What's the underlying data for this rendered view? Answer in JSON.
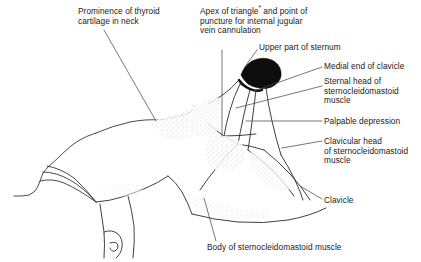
{
  "figure": {
    "type": "anatomical-line-illustration",
    "background_color": "#ffffff",
    "line_color": "#1a1a1a",
    "fill_color": "#000000",
    "stipple_color": "#9a9a9a",
    "text_color": "#1a1a1a"
  },
  "labels": {
    "thyroid": "Prominence of thyroid\ncartilage in neck",
    "apex_line1": "Apex of triangle",
    "apex_marker": "*",
    "apex_line2": " and point of\npuncture for internal jugular\nvein cannulation",
    "sternum": "Upper part of sternum",
    "medial_clavicle": "Medial end of clavicle",
    "sternal_head": "Sternal head of\nsternocleidomastoid\nmuscle",
    "palpable_depression": "Palpable depression",
    "clavicular_head": "Clavicular head\nof sternocleidomastoid\nmuscle",
    "clavicle": "Clavicle",
    "body_scm": "Body of sternocleidomastoid muscle"
  }
}
